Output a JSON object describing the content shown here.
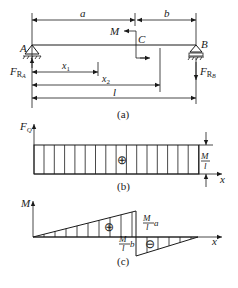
{
  "figure_a": {
    "caption": "(a)",
    "dim_a": "a",
    "dim_b": "b",
    "moment_label": "M",
    "point_c": "C",
    "support_a": "A",
    "support_b": "B",
    "reaction_a": "F",
    "reaction_a_sub": "R",
    "reaction_a_subsub": "A",
    "reaction_b": "F",
    "reaction_b_sub": "R",
    "reaction_b_subsub": "B",
    "x1_label": "x",
    "x1_sub": "1",
    "x2_label": "x",
    "x2_sub": "2",
    "length_label": "l"
  },
  "figure_b": {
    "caption": "(b)",
    "y_axis_label": "F",
    "y_axis_sub": "Q",
    "x_axis_label": "x",
    "sign": "⊕",
    "value_num": "M",
    "value_den": "l"
  },
  "figure_c": {
    "caption": "(c)",
    "y_axis_label": "M",
    "x_axis_label": "x",
    "sign_pos": "⊕",
    "sign_neg": "⊖",
    "max_num": "M",
    "max_den": "l",
    "max_factor": "a",
    "min_num": "M",
    "min_den": "l",
    "min_factor": "b"
  }
}
